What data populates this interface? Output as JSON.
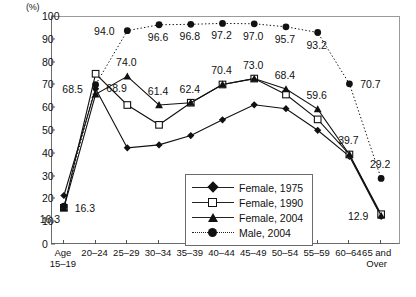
{
  "chart_data": {
    "type": "line",
    "title": "",
    "xlabel": "",
    "ylabel": "(%)",
    "ylim": [
      0,
      100
    ],
    "yticks": [
      0,
      10,
      20,
      30,
      40,
      50,
      60,
      70,
      80,
      90,
      100
    ],
    "grid": false,
    "legend_position": "inside-bottom-center",
    "categories": [
      "Age\n15–19",
      "20–24",
      "25–29",
      "30–34",
      "35–39",
      "40–44",
      "45–49",
      "50–54",
      "55–59",
      "60–64",
      "65 and\nOver"
    ],
    "series": [
      {
        "name": "Female, 1975",
        "marker": "diamond",
        "line": "solid",
        "values": [
          21.7,
          68.5,
          42.6,
          43.9,
          48.0,
          54.9,
          61.5,
          59.8,
          50.3,
          38.9,
          12.5
        ]
      },
      {
        "name": "Female, 1990",
        "marker": "open-square",
        "line": "solid",
        "values": [
          16.3,
          75.1,
          61.4,
          52.7,
          62.4,
          70.4,
          73.0,
          66.0,
          55.1,
          39.7,
          13.5
        ]
      },
      {
        "name": "Female, 2004",
        "marker": "triangle",
        "line": "solid",
        "values": [
          16.3,
          66.1,
          74.0,
          61.4,
          62.4,
          70.4,
          73.0,
          68.4,
          59.6,
          39.7,
          12.9
        ]
      },
      {
        "name": "Male, 2004",
        "marker": "circle",
        "line": "dotted",
        "values": [
          17.0,
          70.3,
          94.0,
          96.6,
          96.8,
          97.2,
          97.0,
          95.7,
          93.2,
          70.7,
          29.2
        ]
      }
    ],
    "point_labels": [
      {
        "text": "16.3",
        "category": "Age\n15–19",
        "value": 16.3,
        "series": "Female, 2004",
        "pos": "right"
      },
      {
        "text": "16.3",
        "category": "Age\n15–19",
        "value": 16.3,
        "series": "Female, 1990",
        "pos": "below-left"
      },
      {
        "text": "68.5",
        "category": "20–24",
        "value": 68.5,
        "series": "Female, 1975",
        "pos": "left"
      },
      {
        "text": "68.9",
        "category": "20–24",
        "value": 68.9,
        "series": "Female, 2004",
        "pos": "right"
      },
      {
        "text": "74.0",
        "category": "25–29",
        "value": 74.0,
        "series": "Female, 2004",
        "pos": "above"
      },
      {
        "text": "94.0",
        "category": "25–29",
        "value": 94.0,
        "series": "Male, 2004",
        "pos": "left"
      },
      {
        "text": "61.4",
        "category": "30–34",
        "value": 61.4,
        "series": "Female, 2004",
        "pos": "above"
      },
      {
        "text": "96.6",
        "category": "30–34",
        "value": 96.6,
        "series": "Male, 2004",
        "pos": "below"
      },
      {
        "text": "62.4",
        "category": "35–39",
        "value": 62.4,
        "series": "Female, 2004",
        "pos": "above"
      },
      {
        "text": "96.8",
        "category": "35–39",
        "value": 96.8,
        "series": "Male, 2004",
        "pos": "below"
      },
      {
        "text": "70.4",
        "category": "40–44",
        "value": 70.4,
        "series": "Female, 1990",
        "pos": "above"
      },
      {
        "text": "97.2",
        "category": "40–44",
        "value": 97.2,
        "series": "Male, 2004",
        "pos": "below"
      },
      {
        "text": "73.0",
        "category": "45–49",
        "value": 73.0,
        "series": "Female, 2004",
        "pos": "above"
      },
      {
        "text": "97.0",
        "category": "45–49",
        "value": 97.0,
        "series": "Male, 2004",
        "pos": "below"
      },
      {
        "text": "68.4",
        "category": "50–54",
        "value": 68.4,
        "series": "Female, 2004",
        "pos": "above"
      },
      {
        "text": "95.7",
        "category": "50–54",
        "value": 95.7,
        "series": "Male, 2004",
        "pos": "below"
      },
      {
        "text": "59.6",
        "category": "55–59",
        "value": 59.6,
        "series": "Female, 2004",
        "pos": "above"
      },
      {
        "text": "93.2",
        "category": "55–59",
        "value": 93.2,
        "series": "Male, 2004",
        "pos": "below"
      },
      {
        "text": "39.7",
        "category": "60–64",
        "value": 39.7,
        "series": "Female, 2004",
        "pos": "above"
      },
      {
        "text": "70.7",
        "category": "60–64",
        "value": 70.7,
        "series": "Male, 2004",
        "pos": "right"
      },
      {
        "text": "29.2",
        "category": "65 and\nOver",
        "value": 29.2,
        "series": "Male, 2004",
        "pos": "above"
      },
      {
        "text": "12.9",
        "category": "65 and\nOver",
        "value": 12.9,
        "series": "Female, 2004",
        "pos": "left"
      }
    ]
  },
  "legend": {
    "items": [
      {
        "label": "Female, 1975"
      },
      {
        "label": "Female, 1990"
      },
      {
        "label": "Female, 2004"
      },
      {
        "label": "Male, 2004"
      }
    ]
  }
}
